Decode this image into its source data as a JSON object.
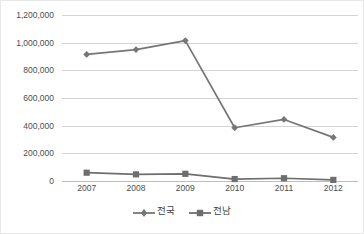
{
  "chart_data": {
    "type": "line",
    "title": "",
    "xlabel": "",
    "ylabel": "",
    "categories": [
      "2007",
      "2008",
      "2009",
      "2010",
      "2011",
      "2012"
    ],
    "series": [
      {
        "name": "전국",
        "marker": "diamond",
        "color": "#767676",
        "values": [
          915000,
          950000,
          1015000,
          385000,
          445000,
          315000
        ]
      },
      {
        "name": "전남",
        "marker": "square",
        "color": "#6e6e6e",
        "values": [
          60000,
          48000,
          52000,
          14000,
          20000,
          8000
        ]
      }
    ],
    "ylim": [
      0,
      1200000
    ],
    "ytick_values": [
      0,
      200000,
      400000,
      600000,
      800000,
      1000000,
      1200000
    ],
    "ytick_labels": [
      "0",
      "200,000",
      "400,000",
      "600,000",
      "800,000",
      "1,000,000",
      "1,200,000"
    ],
    "grid": true,
    "legend_position": "bottom"
  },
  "colors": {
    "gridline": "#d4d4d4",
    "axis": "#bdbdbd",
    "text": "#4d4d4d",
    "series_national": "#767676",
    "series_jeonnam": "#6e6e6e",
    "plot_background": "#ffffff",
    "border": "#e8e8e8"
  }
}
